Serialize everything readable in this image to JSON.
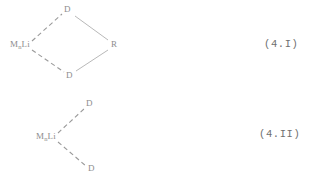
{
  "document": {
    "background_color": "#ffffff",
    "ink_color": "#8d8d8d",
    "equation_ink_color": "#6f6f6f"
  },
  "structures": [
    {
      "id": "structure-4-I",
      "name": "four-membered-bridged-complex",
      "equation_number": "(4.I)",
      "atoms": {
        "metal_symbol": "M",
        "metal_subscript": "n",
        "lithium_symbol": "Li",
        "top_donor": "D",
        "bottom_donor": "D",
        "right_substituent": "R"
      },
      "bonds": [
        {
          "from": "Li",
          "to": "top-D",
          "style": "dashed"
        },
        {
          "from": "Li",
          "to": "bottom-D",
          "style": "dashed"
        },
        {
          "from": "top-D",
          "to": "R",
          "style": "solid"
        },
        {
          "from": "bottom-D",
          "to": "R",
          "style": "solid"
        }
      ]
    },
    {
      "id": "structure-4-II",
      "name": "bis-donor-lithium-complex",
      "equation_number": "(4.II)",
      "atoms": {
        "metal_symbol": "M",
        "metal_subscript": "n",
        "lithium_symbol": "Li",
        "upper_donor": "D",
        "lower_donor": "D"
      },
      "bonds": [
        {
          "from": "Li",
          "to": "upper-D",
          "style": "dashed"
        },
        {
          "from": "Li",
          "to": "lower-D",
          "style": "dashed"
        }
      ]
    }
  ]
}
